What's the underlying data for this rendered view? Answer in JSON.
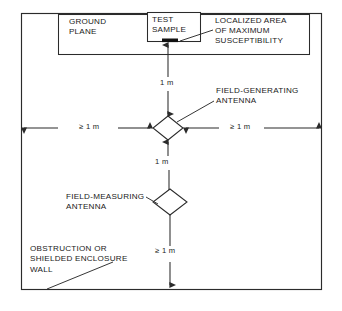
{
  "figure": {
    "type": "technical-diagram",
    "colors": {
      "line": "#2b2b2b",
      "text": "#1a1a1a",
      "background": "#ffffff",
      "fill_mark": "#111111"
    },
    "frame": {
      "name": "obstruction-or-shielded-enclosure-wall",
      "x": 21,
      "y": 13,
      "width": 301,
      "height": 277
    },
    "ground_plane_box": {
      "x": 58,
      "y": 14,
      "width": 252,
      "height": 41
    },
    "test_sample_box": {
      "x": 147,
      "y": 12,
      "width": 54,
      "height": 30
    },
    "labels": {
      "ground_plane": "GROUND\nPLANE",
      "test_sample": "TEST\nSAMPLE",
      "localized_area": "LOCALIZED AREA\nOF MAXIMUM\nSUSCEPTIBILITY",
      "field_generating_antenna": "FIELD-GENERATING\nANTENNA",
      "field_measuring_antenna": "FIELD-MEASURING\nANTENNA",
      "obstruction_wall": "OBSTRUCTION OR\nSHIELDED ENCLOSURE\nWALL"
    },
    "dimensions": {
      "sample_to_generating_antenna": "1 m",
      "generating_to_measuring_antenna": "1 m",
      "left_clearance": "≥ 1 m",
      "right_clearance": "≥ 1 m",
      "bottom_clearance": "≥ 1 m"
    },
    "antennas": {
      "field_generating": {
        "cx": 168,
        "cy": 128,
        "rx": 15,
        "ry": 12
      },
      "field_measuring": {
        "cx": 170,
        "cy": 202,
        "rx": 17,
        "ry": 13
      }
    }
  }
}
